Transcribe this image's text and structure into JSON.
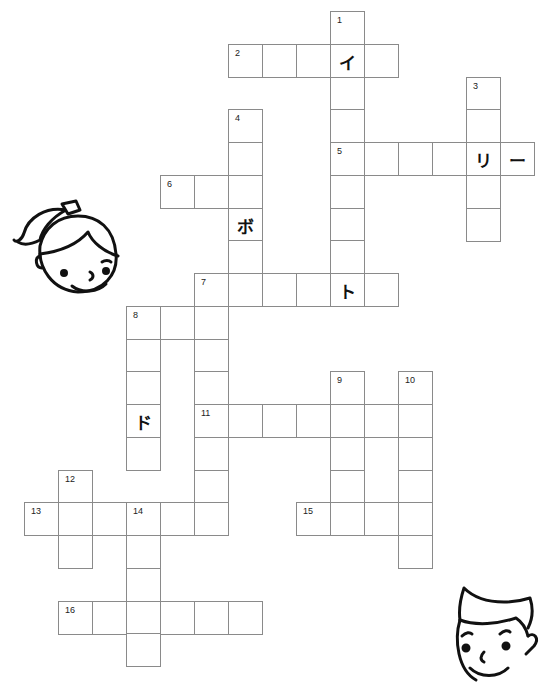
{
  "puzzle": {
    "type": "crossword",
    "grid": {
      "origin_x": 24,
      "origin_y": 11,
      "cell_w": 34,
      "cell_h": 32.75
    },
    "entries": [
      {
        "number": "1",
        "direction": "down",
        "col": 9,
        "row": 0,
        "length": 9
      },
      {
        "number": "2",
        "direction": "across",
        "col": 6,
        "row": 1,
        "length": 5
      },
      {
        "number": "3",
        "direction": "down",
        "col": 13,
        "row": 2,
        "length": 5
      },
      {
        "number": "4",
        "direction": "down",
        "col": 6,
        "row": 3,
        "length": 6
      },
      {
        "number": "5",
        "direction": "across",
        "col": 9,
        "row": 4,
        "length": 6
      },
      {
        "number": "6",
        "direction": "across",
        "col": 4,
        "row": 5,
        "length": 3
      },
      {
        "number": "7",
        "direction": "across",
        "col": 5,
        "row": 8,
        "length": 6
      },
      {
        "number": "7",
        "direction": "down",
        "col": 5,
        "row": 8,
        "length": 8
      },
      {
        "number": "8",
        "direction": "across",
        "col": 3,
        "row": 9,
        "length": 3
      },
      {
        "number": "8",
        "direction": "down",
        "col": 3,
        "row": 9,
        "length": 5
      },
      {
        "number": "9",
        "direction": "down",
        "col": 9,
        "row": 11,
        "length": 5
      },
      {
        "number": "10",
        "direction": "down",
        "col": 11,
        "row": 11,
        "length": 6
      },
      {
        "number": "11",
        "direction": "across",
        "col": 5,
        "row": 12,
        "length": 7
      },
      {
        "number": "12",
        "direction": "down",
        "col": 1,
        "row": 14,
        "length": 3
      },
      {
        "number": "13",
        "direction": "across",
        "col": 0,
        "row": 15,
        "length": 6
      },
      {
        "number": "14",
        "direction": "down",
        "col": 3,
        "row": 15,
        "length": 5
      },
      {
        "number": "15",
        "direction": "across",
        "col": 8,
        "row": 15,
        "length": 4
      },
      {
        "number": "16",
        "direction": "across",
        "col": 1,
        "row": 18,
        "length": 6
      }
    ],
    "given_letters": [
      {
        "col": 9,
        "row": 1,
        "char": "イ"
      },
      {
        "col": 13,
        "row": 4,
        "char": "リ"
      },
      {
        "col": 14,
        "row": 4,
        "char": "ー"
      },
      {
        "col": 6,
        "row": 6,
        "char": "ボ"
      },
      {
        "col": 9,
        "row": 8,
        "char": "ト"
      },
      {
        "col": 3,
        "row": 12,
        "char": "ド"
      }
    ]
  },
  "illustrations": [
    {
      "name": "girl-face",
      "position": "left-middle"
    },
    {
      "name": "boy-face",
      "position": "bottom-right"
    }
  ],
  "colors": {
    "grid_line": "#8a8a8a",
    "text": "#111111",
    "background": "#ffffff"
  }
}
